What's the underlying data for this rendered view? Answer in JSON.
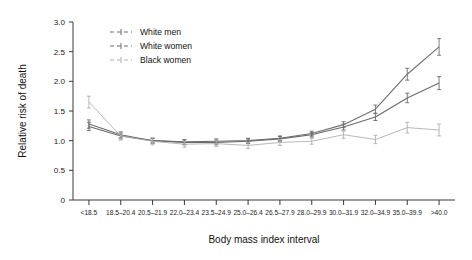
{
  "chart_data": {
    "type": "line",
    "title": "",
    "xlabel": "Body mass index interval",
    "ylabel": "Relative risk of death",
    "categories": [
      "<18.5",
      "18.5–20.4",
      "20.5–21.9",
      "22.0–23.4",
      "23.5–24.9",
      "25.0–26.4",
      "26.5–27.9",
      "28.0–29.9",
      "30.0–31.9",
      "32.0–34.9",
      "35.0–39.9",
      ">40.0"
    ],
    "ylim": [
      0,
      3.0
    ],
    "yticks": [
      "0",
      "0.5",
      "1.0",
      "1.5",
      "2.0",
      "2.5",
      "3.0"
    ],
    "ytick_values": [
      0,
      0.5,
      1.0,
      1.5,
      2.0,
      2.5,
      3.0
    ],
    "grid": false,
    "legend_position": "top-center",
    "error_bars": true,
    "series": [
      {
        "name": "White men",
        "color": "#6e6e6e",
        "values": [
          1.28,
          1.1,
          1.0,
          0.98,
          0.99,
          1.0,
          1.04,
          1.12,
          1.27,
          1.53,
          2.12,
          2.58
        ],
        "err": [
          0.07,
          0.05,
          0.04,
          0.04,
          0.04,
          0.04,
          0.04,
          0.04,
          0.05,
          0.07,
          0.1,
          0.14
        ]
      },
      {
        "name": "White women",
        "color": "#6a6a6a",
        "values": [
          1.24,
          1.08,
          1.0,
          0.97,
          0.97,
          0.99,
          1.03,
          1.1,
          1.23,
          1.4,
          1.72,
          1.97
        ],
        "err": [
          0.07,
          0.05,
          0.04,
          0.04,
          0.04,
          0.04,
          0.04,
          0.04,
          0.05,
          0.06,
          0.08,
          0.11
        ]
      },
      {
        "name": "Black women",
        "color": "#b0b0b0",
        "values": [
          1.65,
          1.08,
          0.99,
          0.94,
          0.95,
          0.92,
          0.97,
          0.99,
          1.1,
          1.02,
          1.22,
          1.18
        ],
        "err": [
          0.1,
          0.07,
          0.06,
          0.05,
          0.05,
          0.05,
          0.05,
          0.05,
          0.06,
          0.07,
          0.09,
          0.1
        ]
      }
    ]
  },
  "legend": {
    "items": [
      {
        "label": "White men"
      },
      {
        "label": "White women"
      },
      {
        "label": "Black women"
      }
    ]
  }
}
